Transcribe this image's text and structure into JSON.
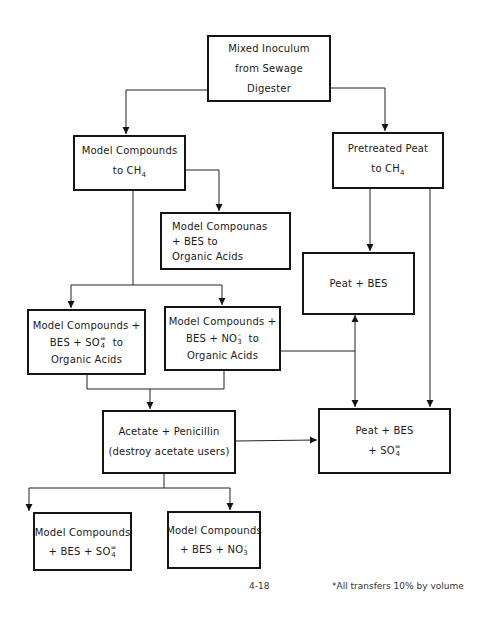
{
  "diagram": {
    "type": "flowchart",
    "nodes": [
      {
        "id": "inoculum",
        "lines": [
          "Mixed Inoculum",
          "from Sewage",
          "Digester"
        ]
      },
      {
        "id": "mc_ch4",
        "lines": [
          "Model Compounds",
          "to  CH"
        ],
        "sub": "4"
      },
      {
        "id": "peat_ch4",
        "lines": [
          "Pretreated Peat",
          "to  CH"
        ],
        "sub": "4"
      },
      {
        "id": "mc_bes_oa",
        "lines": [
          "Model Compounas",
          "+ BES to",
          "Organic Acids"
        ]
      },
      {
        "id": "peat_bes",
        "lines": [
          "Peat +  BES"
        ]
      },
      {
        "id": "mc_bes_so4_oa",
        "lines": [
          "Model Compounds +",
          "BES + SO",
          "to",
          "Organic Acids"
        ],
        "ion_sup": "=",
        "ion_sub": "4"
      },
      {
        "id": "mc_bes_no3_oa",
        "lines": [
          "Model Compounds +",
          "BES + NO",
          "to",
          "Organic Acids"
        ],
        "ion_sup": "-",
        "ion_sub": "3"
      },
      {
        "id": "acetate_pen",
        "lines": [
          "Acetate + Penicillin",
          "(destroy acetate users)"
        ]
      },
      {
        "id": "peat_bes_so4",
        "lines": [
          "Peat + BES",
          "+   SO"
        ],
        "ion_sup": "=",
        "ion_sub": "4"
      },
      {
        "id": "mc_bes_so4",
        "lines": [
          "Model Compounds",
          "+  BES +  SO"
        ],
        "ion_sup": "=",
        "ion_sub": "4"
      },
      {
        "id": "mc_bes_no3",
        "lines": [
          "Model Compounds",
          "+  BES +  NO"
        ],
        "ion_sup": "-",
        "ion_sub": "3"
      }
    ],
    "edges": [
      {
        "from": "inoculum",
        "to": "mc_ch4"
      },
      {
        "from": "inoculum",
        "to": "peat_ch4"
      },
      {
        "from": "mc_ch4",
        "to": "mc_bes_oa"
      },
      {
        "from": "mc_ch4",
        "to": "mc_bes_so4_oa"
      },
      {
        "from": "mc_ch4",
        "to": "mc_bes_no3_oa"
      },
      {
        "from": "peat_ch4",
        "to": "peat_bes"
      },
      {
        "from": "peat_ch4",
        "to": "peat_bes_so4"
      },
      {
        "from": "mc_bes_no3_oa",
        "to": "peat_bes"
      },
      {
        "from": "mc_bes_no3_oa",
        "to": "peat_bes_so4"
      },
      {
        "from": "mc_bes_so4_oa",
        "to": "acetate_pen"
      },
      {
        "from": "mc_bes_no3_oa",
        "to": "acetate_pen"
      },
      {
        "from": "acetate_pen",
        "to": "peat_bes_so4"
      },
      {
        "from": "acetate_pen",
        "to": "mc_bes_so4"
      },
      {
        "from": "acetate_pen",
        "to": "mc_bes_no3"
      }
    ]
  },
  "footer": {
    "page_number": "4-18",
    "note": "*All transfers 10% by volume"
  }
}
